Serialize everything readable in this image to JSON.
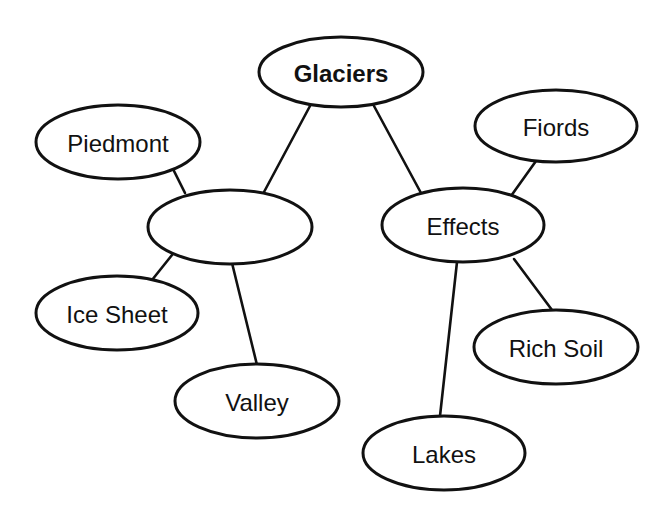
{
  "diagram": {
    "type": "concept-map",
    "stroke_color": "#111111",
    "background": "#ffffff",
    "nodes": [
      {
        "id": "glaciers",
        "label": "Glaciers",
        "cx": 341,
        "cy": 72,
        "rx": 82,
        "ry": 35,
        "bold": true
      },
      {
        "id": "blank",
        "label": "",
        "cx": 230,
        "cy": 227,
        "rx": 82,
        "ry": 37,
        "bold": false
      },
      {
        "id": "piedmont",
        "label": "Piedmont",
        "cx": 118,
        "cy": 142,
        "rx": 82,
        "ry": 37,
        "bold": false
      },
      {
        "id": "ice-sheet",
        "label": "Ice Sheet",
        "cx": 117,
        "cy": 313,
        "rx": 81,
        "ry": 37,
        "bold": false
      },
      {
        "id": "valley",
        "label": "Valley",
        "cx": 257,
        "cy": 401,
        "rx": 82,
        "ry": 37,
        "bold": false
      },
      {
        "id": "effects",
        "label": "Effects",
        "cx": 463,
        "cy": 225,
        "rx": 81,
        "ry": 37,
        "bold": false
      },
      {
        "id": "fiords",
        "label": "Fiords",
        "cx": 556,
        "cy": 126,
        "rx": 81,
        "ry": 36,
        "bold": false
      },
      {
        "id": "rich-soil",
        "label": "Rich Soil",
        "cx": 556,
        "cy": 347,
        "rx": 82,
        "ry": 37,
        "bold": false
      },
      {
        "id": "lakes",
        "label": "Lakes",
        "cx": 444,
        "cy": 453,
        "rx": 81,
        "ry": 37,
        "bold": false
      }
    ],
    "edges": [
      {
        "from": "glaciers",
        "to": "blank",
        "x1": 310,
        "y1": 106,
        "x2": 264,
        "y2": 192
      },
      {
        "from": "glaciers",
        "to": "effects",
        "x1": 374,
        "y1": 106,
        "x2": 421,
        "y2": 193
      },
      {
        "from": "piedmont",
        "to": "blank",
        "x1": 173,
        "y1": 169,
        "x2": 185,
        "y2": 193
      },
      {
        "from": "blank",
        "to": "ice-sheet",
        "x1": 172,
        "y1": 255,
        "x2": 152,
        "y2": 280
      },
      {
        "from": "blank",
        "to": "valley",
        "x1": 232,
        "y1": 263,
        "x2": 257,
        "y2": 365
      },
      {
        "from": "fiords",
        "to": "effects",
        "x1": 536,
        "y1": 161,
        "x2": 511,
        "y2": 196
      },
      {
        "from": "effects",
        "to": "rich-soil",
        "x1": 514,
        "y1": 259,
        "x2": 552,
        "y2": 310
      },
      {
        "from": "effects",
        "to": "lakes",
        "x1": 457,
        "y1": 262,
        "x2": 440,
        "y2": 416
      }
    ]
  }
}
